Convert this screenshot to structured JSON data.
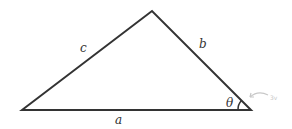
{
  "diagram": {
    "type": "triangle",
    "vertices": {
      "left": [
        22,
        110
      ],
      "top": [
        152,
        11
      ],
      "right": [
        251,
        110
      ]
    },
    "sides": {
      "a": "a",
      "b": "b",
      "c": "c"
    },
    "angle_label": "θ",
    "annotation": "3v",
    "colors": {
      "stroke": "#333333",
      "annotation": "#c8c8c8"
    }
  }
}
